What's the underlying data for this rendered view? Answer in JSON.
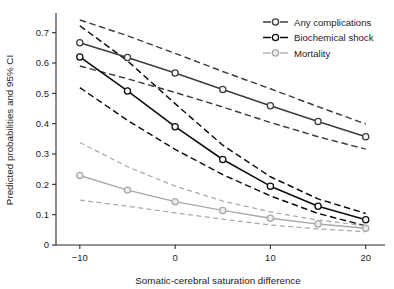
{
  "chart_data": {
    "type": "line",
    "title": "",
    "xlabel": "Somatic-cerebral saturation difference",
    "ylabel": "Predicted probabilities and 95% CI",
    "x": [
      -10,
      -5,
      0,
      5,
      10,
      15,
      20
    ],
    "xlim": [
      -12.5,
      21.5
    ],
    "ylim": [
      0,
      0.755
    ],
    "xticks": [
      -10,
      0,
      10,
      20
    ],
    "xtick_labels": [
      "−10",
      "0",
      "10",
      "20"
    ],
    "yticks": [
      0,
      0.1,
      0.2,
      0.3,
      0.4,
      0.5,
      0.6,
      0.7
    ],
    "ytick_labels": [
      "0",
      "0.1",
      "0.2",
      "0.3",
      "0.4",
      "0.5",
      "0.6",
      "0.7"
    ],
    "grid": false,
    "legend_position": "top-right",
    "marker": "open-circle",
    "ci_style": "dashed",
    "series": [
      {
        "name": "Any complications",
        "color": "#3c3c3c",
        "values": [
          0.667,
          0.618,
          0.567,
          0.513,
          0.459,
          0.407,
          0.357
        ],
        "ci_upper": [
          0.742,
          0.69,
          0.632,
          0.572,
          0.515,
          0.456,
          0.399
        ],
        "ci_lower": [
          0.59,
          0.548,
          0.503,
          0.455,
          0.404,
          0.357,
          0.316
        ]
      },
      {
        "name": "Biochemical shock",
        "color": "#0d0d0d",
        "values": [
          0.62,
          0.508,
          0.39,
          0.282,
          0.194,
          0.128,
          0.083
        ],
        "ci_upper": [
          0.723,
          0.607,
          0.466,
          0.329,
          0.225,
          0.152,
          0.104
        ],
        "ci_lower": [
          0.519,
          0.411,
          0.315,
          0.232,
          0.162,
          0.104,
          0.063
        ]
      },
      {
        "name": "Mortality",
        "color": "#a9a9a9",
        "values": [
          0.229,
          0.181,
          0.143,
          0.114,
          0.088,
          0.069,
          0.055
        ],
        "ci_upper": [
          0.338,
          0.258,
          0.194,
          0.145,
          0.109,
          0.082,
          0.063
        ],
        "ci_lower": [
          0.148,
          0.128,
          0.106,
          0.085,
          0.066,
          0.053,
          0.044
        ]
      }
    ]
  },
  "legend": {
    "items": [
      {
        "label": "Any complications",
        "color": "#3c3c3c"
      },
      {
        "label": "Biochemical shock",
        "color": "#0d0d0d"
      },
      {
        "label": "Mortality",
        "color": "#a9a9a9"
      }
    ]
  },
  "axes": {
    "x_title": "Somatic-cerebral saturation difference",
    "y_title": "Predicted probabilities and 95% CI"
  }
}
